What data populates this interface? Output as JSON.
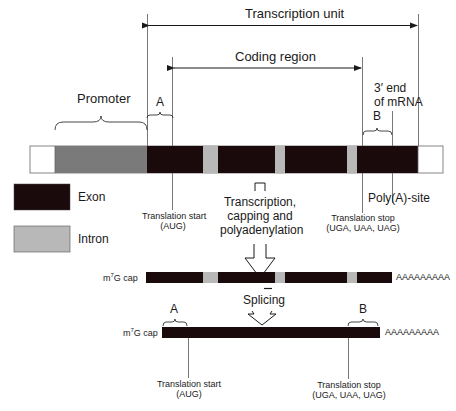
{
  "diagram": {
    "type": "gene-structure",
    "top_labels": {
      "transcription_unit": "Transcription unit",
      "coding_region": "Coding region",
      "promoter": "Promoter",
      "region_a": "A",
      "region_b": "B",
      "three_prime_end_line1": "3′ end",
      "three_prime_end_line2": "of mRNA",
      "poly_a_site": "Poly(A)-site"
    },
    "legend": [
      {
        "label": "Exon",
        "color": "#1a0a0c"
      },
      {
        "label": "Intron",
        "color": "#b8b8b8"
      }
    ],
    "gene_segments": [
      {
        "kind": "flank",
        "color": "#ffffff"
      },
      {
        "kind": "promoter",
        "color": "#7a7a7a"
      },
      {
        "kind": "exon",
        "color": "#1a0a0c"
      },
      {
        "kind": "intron",
        "color": "#b8b8b8"
      },
      {
        "kind": "exon",
        "color": "#1a0a0c"
      },
      {
        "kind": "intron",
        "color": "#b8b8b8"
      },
      {
        "kind": "exon",
        "color": "#1a0a0c"
      },
      {
        "kind": "intron",
        "color": "#b8b8b8"
      },
      {
        "kind": "exon",
        "color": "#1a0a0c"
      },
      {
        "kind": "flank",
        "color": "#ffffff"
      }
    ],
    "gene_annotations": {
      "translation_start_line1": "Translation start",
      "translation_start_line2": "(AUG)",
      "translation_stop_line1": "Translation stop",
      "translation_stop_line2": "(UGA, UAA, UAG)"
    },
    "step1": {
      "line1": "Transcription,",
      "line2": "capping and",
      "line3": "polyadenylation"
    },
    "pre_mrna": {
      "cap_label_prefix": "m",
      "cap_label_sup": "7",
      "cap_label_suffix": "G cap",
      "poly_a_tail": "AAAAAAAAA"
    },
    "step2": {
      "label": "Splicing"
    },
    "mature_mrna": {
      "cap_label_prefix": "m",
      "cap_label_sup": "7",
      "cap_label_suffix": "G cap",
      "poly_a_tail": "AAAAAAAAA",
      "region_a": "A",
      "region_b": "B",
      "translation_start_line1": "Translation start",
      "translation_start_line2": "(AUG)",
      "translation_stop_line1": "Translation stop",
      "translation_stop_line2": "(UGA, UAA, UAG)"
    }
  }
}
